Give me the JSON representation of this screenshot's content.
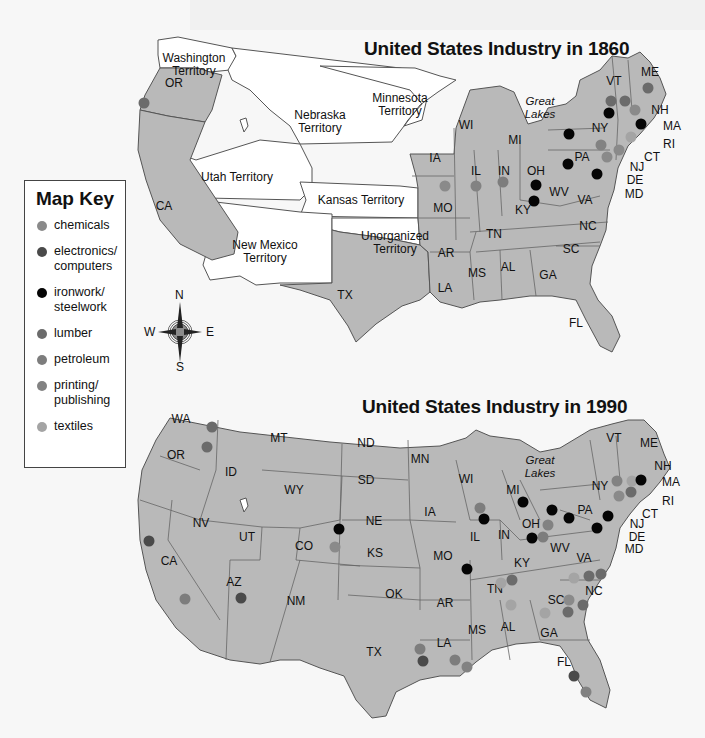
{
  "colors": {
    "state": "#b9b9b9",
    "territory": "#ffffff",
    "border": "#555555",
    "chemicals": "#8a8a8a",
    "electronics_computers": "#4a4a4a",
    "ironwork_steelwork": "#050505",
    "lumber": "#6b6b6b",
    "petroleum": "#7d7d7d",
    "printing_publishing": "#828282",
    "textiles": "#a4a4a4"
  },
  "legend": {
    "title": "Map Key",
    "items": [
      {
        "key": "chemicals",
        "label_1": "chemicals",
        "label_2": ""
      },
      {
        "key": "electronics_computers",
        "label_1": "electronics/",
        "label_2": "computers"
      },
      {
        "key": "ironwork_steelwork",
        "label_1": "ironwork/",
        "label_2": "steelwork"
      },
      {
        "key": "lumber",
        "label_1": "lumber",
        "label_2": ""
      },
      {
        "key": "petroleum",
        "label_1": "petroleum",
        "label_2": ""
      },
      {
        "key": "printing_publishing",
        "label_1": "printing/",
        "label_2": "publishing"
      },
      {
        "key": "textiles",
        "label_1": "textiles",
        "label_2": ""
      }
    ]
  },
  "compass": {
    "n": "N",
    "s": "S",
    "e": "E",
    "w": "W"
  },
  "map_1860": {
    "title": "United States Industry in 1860",
    "territories": [
      "Washington Territory",
      "Nebraska Territory",
      "Minnesota Territory",
      "Utah Territory",
      "Kansas Territory",
      "New Mexico Territory",
      "Unorganized Territory"
    ],
    "states": [
      "OR",
      "CA",
      "TX",
      "IA",
      "MO",
      "AR",
      "LA",
      "WI",
      "IL",
      "MI",
      "IN",
      "OH",
      "KY",
      "TN",
      "MS",
      "AL",
      "GA",
      "FL",
      "SC",
      "NC",
      "VA",
      "WV",
      "PA",
      "NY",
      "VT",
      "NH",
      "ME",
      "MA",
      "RI",
      "CT",
      "NJ",
      "DE",
      "MD"
    ],
    "water_label": "Great Lakes"
  },
  "map_1990": {
    "title": "United States Industry in 1990",
    "states": [
      "WA",
      "OR",
      "CA",
      "ID",
      "NV",
      "MT",
      "WY",
      "UT",
      "AZ",
      "CO",
      "NM",
      "ND",
      "SD",
      "NE",
      "KS",
      "OK",
      "TX",
      "MN",
      "IA",
      "MO",
      "AR",
      "LA",
      "WI",
      "IL",
      "MI",
      "IN",
      "OH",
      "KY",
      "TN",
      "MS",
      "AL",
      "GA",
      "FL",
      "SC",
      "NC",
      "VA",
      "WV",
      "PA",
      "NY",
      "VT",
      "NH",
      "ME",
      "MA",
      "RI",
      "CT",
      "NJ",
      "DE",
      "MD"
    ],
    "water_label": "Great Lakes"
  },
  "labels": {
    "washington_territory_1": "Washington",
    "washington_territory_2": "Territory",
    "nebraska_territory_1": "Nebraska",
    "nebraska_territory_2": "Territory",
    "minnesota_territory_1": "Minnesota",
    "minnesota_territory_2": "Territory",
    "utah_territory": "Utah Territory",
    "kansas_territory": "Kansas Territory",
    "new_mexico_territory_1": "New Mexico",
    "new_mexico_territory_2": "Territory",
    "unorganized_territory_1": "Unorganized",
    "unorganized_territory_2": "Territory",
    "great": "Great",
    "lakes": "Lakes",
    "OR": "OR",
    "CA": "CA",
    "TX": "TX",
    "IA": "IA",
    "MO": "MO",
    "AR": "AR",
    "LA": "LA",
    "WI": "WI",
    "IL": "IL",
    "MI": "MI",
    "IN": "IN",
    "OH": "OH",
    "KY": "KY",
    "TN": "TN",
    "MS": "MS",
    "AL": "AL",
    "GA": "GA",
    "FL": "FL",
    "SC": "SC",
    "NC": "NC",
    "VA": "VA",
    "WV": "WV",
    "PA": "PA",
    "NY": "NY",
    "VT": "VT",
    "NH": "NH",
    "ME": "ME",
    "MA": "MA",
    "RI": "RI",
    "CT": "CT",
    "NJ": "NJ",
    "DE": "DE",
    "MD": "MD",
    "WA": "WA",
    "ID": "ID",
    "NV": "NV",
    "MT": "MT",
    "WY": "WY",
    "UT": "UT",
    "AZ": "AZ",
    "CO": "CO",
    "NM": "NM",
    "ND": "ND",
    "SD": "SD",
    "NE": "NE",
    "KS": "KS",
    "OK": "OK",
    "MN": "MN"
  }
}
